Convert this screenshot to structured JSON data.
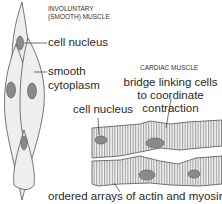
{
  "smooth_muscle": {
    "title_line1": "INVOLUNTARY",
    "title_line2": "(SMOOTH) MUSCLE",
    "label_nucleus": "cell nucleus",
    "label_cytoplasm_line1": "smooth",
    "label_cytoplasm_line2": "cytoplasm"
  },
  "cardiac_muscle": {
    "title": "CARDIAC MUSCLE",
    "label_bridge_line1": "bridge linking cells",
    "label_bridge_line2": "to coordinate",
    "label_bridge_line3": "contraction",
    "label_nucleus": "cell nucleus",
    "label_arrays": "ordered arrays of actin and myosin"
  },
  "colors": {
    "cell_fill": "#ececec",
    "cell_outline": "#555555",
    "nucleus_fill": "#8a8a8a",
    "stripe": "#6a6a6a"
  }
}
